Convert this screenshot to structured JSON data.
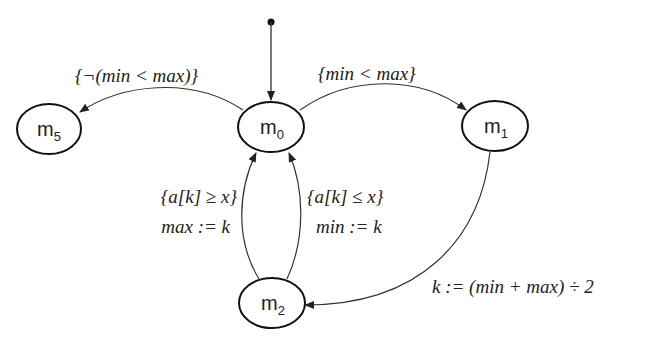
{
  "diagram": {
    "type": "state-machine",
    "states": [
      {
        "id": "m0",
        "name": "m",
        "sub": "0"
      },
      {
        "id": "m1",
        "name": "m",
        "sub": "1"
      },
      {
        "id": "m2",
        "name": "m",
        "sub": "2"
      },
      {
        "id": "m5",
        "name": "m",
        "sub": "5"
      }
    ],
    "initial": "m0",
    "edges": [
      {
        "from": "m0",
        "to": "m5",
        "label": "{¬(min < max)}"
      },
      {
        "from": "m0",
        "to": "m1",
        "label": "{min < max}"
      },
      {
        "from": "m1",
        "to": "m2",
        "label": "k := (min + max) ÷ 2"
      },
      {
        "from": "m2",
        "to": "m0",
        "label_line1": "{a[k] ≥ x}",
        "label_line2": "max := k"
      },
      {
        "from": "m2",
        "to": "m0",
        "label_line1": "{a[k] ≤ x}",
        "label_line2": "min := k"
      }
    ]
  }
}
